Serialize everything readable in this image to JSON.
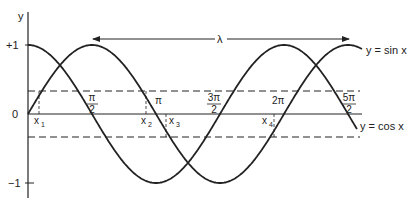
{
  "diagram": {
    "title": "",
    "axes": {
      "y_label": "y",
      "y_ticks": [
        {
          "label": "+1",
          "value": 1
        },
        {
          "label": "0",
          "value": 0
        },
        {
          "label": "−1",
          "value": -1
        }
      ]
    },
    "x_ticks": [
      {
        "num": "π",
        "den": "2",
        "value": "π/2"
      },
      {
        "label": "π",
        "value": "π"
      },
      {
        "num": "3π",
        "den": "2",
        "value": "3π/2"
      },
      {
        "label": "2π",
        "value": "2π"
      },
      {
        "num": "5π",
        "den": "2",
        "value": "5π/2"
      }
    ],
    "x_points": [
      {
        "base": "x",
        "sub": "1"
      },
      {
        "base": "x",
        "sub": "2"
      },
      {
        "base": "x",
        "sub": "3"
      },
      {
        "base": "x",
        "sub": "4"
      }
    ],
    "wavelength_label": "λ",
    "curves": [
      {
        "name": "sin",
        "label": "y = sin x"
      },
      {
        "name": "cos",
        "label": "y = cos x"
      }
    ],
    "dashed_levels": [
      "+a",
      "−a"
    ],
    "colors": {
      "line": "#222222",
      "background": "#ffffff"
    }
  }
}
